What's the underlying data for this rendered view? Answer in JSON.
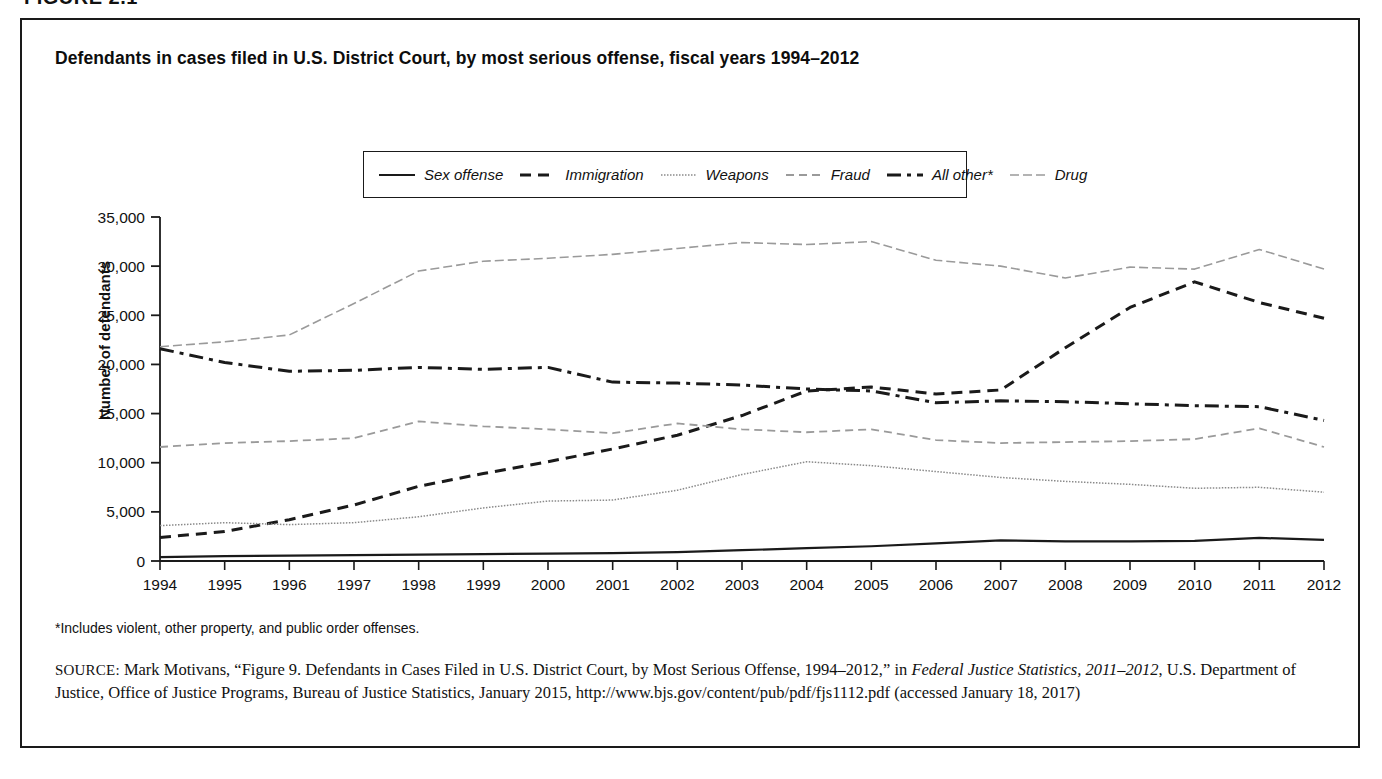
{
  "figure": {
    "label": "FIGURE 2.1"
  },
  "panel": {
    "title": "Defendants in cases filed in U.S. District Court, by most serious offense, fiscal years 1994–2012"
  },
  "legend": {
    "items": [
      {
        "label": "Sex offense",
        "style": "solid",
        "color": "#1a1a1a",
        "width": 2.2,
        "dash": ""
      },
      {
        "label": "Immigration",
        "style": "dashed",
        "color": "#1a1a1a",
        "width": 3.0,
        "dash": "11,7"
      },
      {
        "label": "Weapons",
        "style": "dotted",
        "color": "#8a8a8a",
        "width": 1.5,
        "dash": "1.5,1.5"
      },
      {
        "label": "Fraud",
        "style": "dashed-light",
        "color": "#9a9a9a",
        "width": 1.8,
        "dash": "8,5"
      },
      {
        "label": "All other*",
        "style": "dash-dot",
        "color": "#1a1a1a",
        "width": 3.0,
        "dash": "14,6,4,6"
      },
      {
        "label": "Drug",
        "style": "dash-light",
        "color": "#9a9a9a",
        "width": 1.6,
        "dash": "9,4"
      }
    ]
  },
  "footnote": {
    "text": "*Includes violent, other property, and public order offenses."
  },
  "source": {
    "prefix": "SOURCE:",
    "part1": " Mark Motivans, “Figure 9. Defendants in Cases Filed in U.S. District Court, by Most Serious Offense, 1994–2012,” in ",
    "italic1": "Federal Justice Statistics, 2011–2012",
    "part2": ", U.S. Department of Justice, Office of Justice Programs, Bureau of Justice Statistics, January 2015, http://www.bjs.gov/content/pub/pdf/fjs1112.pdf (accessed January 18, 2017)"
  },
  "chart_data": {
    "type": "line",
    "title": "Defendants in cases filed in U.S. District Court, by most serious offense, fiscal years 1994–2012",
    "xlabel": "",
    "ylabel": "Number of defendants",
    "x": [
      1994,
      1995,
      1996,
      1997,
      1998,
      1999,
      2000,
      2001,
      2002,
      2003,
      2004,
      2005,
      2006,
      2007,
      2008,
      2009,
      2010,
      2011,
      2012
    ],
    "xtick_labels": [
      "1994",
      "1995",
      "1996",
      "1997",
      "1998",
      "1999",
      "2000",
      "2001",
      "2002",
      "2003",
      "2004",
      "2005",
      "2006",
      "2007",
      "2008",
      "2009",
      "2010",
      "2011",
      "2012"
    ],
    "ytick_labels": [
      "0",
      "5,000",
      "10,000",
      "15,000",
      "20,000",
      "25,000",
      "30,000",
      "35,000"
    ],
    "yticks": [
      0,
      5000,
      10000,
      15000,
      20000,
      25000,
      30000,
      35000
    ],
    "ylim": [
      0,
      35000
    ],
    "xlim": [
      1994,
      2012
    ],
    "grid": false,
    "legend_position": "top-center",
    "series": [
      {
        "name": "Drug",
        "values": [
          21800,
          22300,
          23000,
          26200,
          29500,
          30500,
          30800,
          31200,
          31800,
          32400,
          32200,
          32500,
          30600,
          30000,
          28800,
          29900,
          29700,
          31700,
          29700
        ]
      },
      {
        "name": "All other*",
        "values": [
          21600,
          20200,
          19300,
          19400,
          19700,
          19500,
          19700,
          18200,
          18100,
          17900,
          17500,
          17300,
          16100,
          16300,
          16200,
          16000,
          15800,
          15700,
          14300
        ]
      },
      {
        "name": "Immigration",
        "values": [
          2400,
          3000,
          4200,
          5700,
          7600,
          8900,
          10100,
          11400,
          12800,
          14800,
          17300,
          17700,
          17000,
          17400,
          21700,
          25800,
          28400,
          26300,
          24700
        ]
      },
      {
        "name": "Fraud",
        "values": [
          11600,
          12000,
          12200,
          12500,
          14200,
          13700,
          13400,
          13000,
          14000,
          13400,
          13100,
          13400,
          12300,
          12000,
          12100,
          12200,
          12400,
          13500,
          11600
        ]
      },
      {
        "name": "Weapons",
        "values": [
          3600,
          3900,
          3700,
          3900,
          4500,
          5400,
          6100,
          6200,
          7200,
          8800,
          10100,
          9700,
          9100,
          8500,
          8100,
          7800,
          7400,
          7500,
          7000
        ]
      },
      {
        "name": "Sex offense",
        "values": [
          400,
          500,
          550,
          600,
          650,
          700,
          750,
          800,
          900,
          1100,
          1300,
          1500,
          1800,
          2100,
          2000,
          2000,
          2050,
          2350,
          2150
        ]
      }
    ]
  }
}
